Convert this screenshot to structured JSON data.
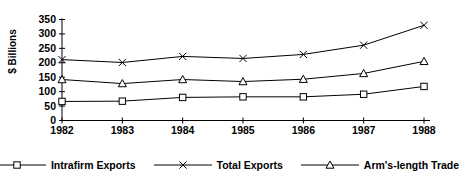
{
  "chart_data": {
    "type": "line",
    "title": "",
    "xlabel": "",
    "ylabel": "$ Billions",
    "categories": [
      "1982",
      "1983",
      "1984",
      "1985",
      "1986",
      "1987",
      "1988"
    ],
    "ylim": [
      0,
      350
    ],
    "ytick_labels": [
      "0",
      "50",
      "100",
      "150",
      "200",
      "250",
      "300",
      "350"
    ],
    "ytick_values": [
      0,
      50,
      100,
      150,
      200,
      250,
      300,
      350
    ],
    "ytick_step": 50,
    "grid": false,
    "legend_position": "bottom",
    "series": [
      {
        "name": "Intrafirm Exports",
        "marker": "square",
        "color": "#000000",
        "values": [
          66,
          67,
          80,
          82,
          82,
          91,
          118
        ]
      },
      {
        "name": "Total Exports",
        "marker": "x",
        "color": "#000000",
        "values": [
          211,
          201,
          222,
          215,
          229,
          261,
          330
        ]
      },
      {
        "name": "Arm's-length Trade",
        "marker": "triangle",
        "color": "#000000",
        "values": [
          142,
          128,
          142,
          135,
          143,
          163,
          205
        ]
      }
    ]
  },
  "legend": {
    "items": [
      {
        "label": "Intrafirm Exports",
        "marker": "square-marker-icon"
      },
      {
        "label": "Total Exports",
        "marker": "x-marker-icon"
      },
      {
        "label": "Arm's-length Trade",
        "marker": "triangle-marker-icon"
      }
    ]
  },
  "axes": {
    "y_title": "$ Billions"
  }
}
